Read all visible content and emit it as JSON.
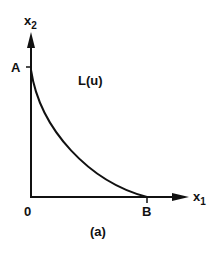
{
  "figure": {
    "caption": "(a)",
    "axes": {
      "x_label": "x",
      "x_subscript": "1",
      "y_label": "x",
      "y_subscript": "2",
      "origin_label": "0"
    },
    "points": {
      "a_label": "A",
      "b_label": "B"
    },
    "curve": {
      "label": "L(u)"
    },
    "colors": {
      "ink": "#111111",
      "background": "#ffffff"
    }
  }
}
